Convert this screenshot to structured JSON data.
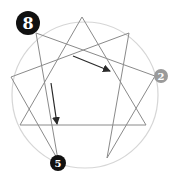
{
  "diagram": {
    "type": "enneagram",
    "circle": {
      "cx": 85,
      "cy": 95,
      "r": 73,
      "stroke": "#d6d6d6"
    },
    "line_color": "#8a8a8a",
    "arrow_color": "#2a2a2a",
    "points": {
      "p9": [
        82,
        17
      ],
      "p1": [
        129,
        33
      ],
      "p2": [
        155,
        76
      ],
      "p3": [
        146,
        125
      ],
      "p4": [
        107,
        158
      ],
      "p5": [
        58,
        160
      ],
      "p6": [
        20,
        125
      ],
      "p7": [
        11,
        77
      ],
      "p8": [
        36,
        33
      ]
    },
    "badges": [
      {
        "label": "8",
        "x": 28,
        "y": 23,
        "r": 12,
        "fill": "#111111",
        "text_color": "#ffffff",
        "font_size": 16
      },
      {
        "label": "2",
        "x": 161,
        "y": 76,
        "r": 7,
        "fill": "#9a9a9a",
        "text_color": "#ffffff",
        "font_size": 10
      },
      {
        "label": "5",
        "x": 58,
        "y": 163,
        "r": 8,
        "fill": "#111111",
        "text_color": "#ffffff",
        "font_size": 10
      }
    ],
    "arrows": [
      {
        "name": "arrow-8-to-2",
        "from": [
          73,
          56
        ],
        "to": [
          110,
          71
        ]
      },
      {
        "name": "arrow-8-to-5",
        "from": [
          51,
          83
        ],
        "to": [
          57,
          124
        ]
      }
    ]
  }
}
